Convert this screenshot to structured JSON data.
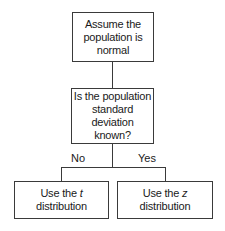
{
  "diagram": {
    "type": "flowchart",
    "nodes": {
      "assume": {
        "text_line1": "Assume the",
        "text_line2": "population is",
        "text_line3": "normal"
      },
      "question": {
        "text_line1": "Is the population",
        "text_line2": "standard",
        "text_line3": "deviation known?"
      },
      "t_dist": {
        "prefix": "Use the ",
        "var": "t",
        "suffix": " distribution"
      },
      "z_dist": {
        "prefix": "Use the ",
        "var": "z",
        "suffix": " distribution"
      }
    },
    "edges": {
      "no_label": "No",
      "yes_label": "Yes"
    },
    "line_color": "#3a3a3a"
  }
}
